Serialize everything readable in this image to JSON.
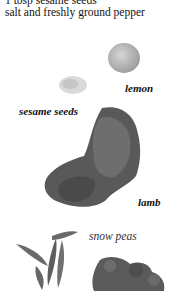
{
  "ingredients": [
    "1 tbsp sesame seeds",
    "salt and freshly ground pepper"
  ],
  "labels": {
    "lemon": "lemon",
    "sesame_seeds": "sesame seeds",
    "lamb": "lamb",
    "snow_peas": "snow peas"
  }
}
